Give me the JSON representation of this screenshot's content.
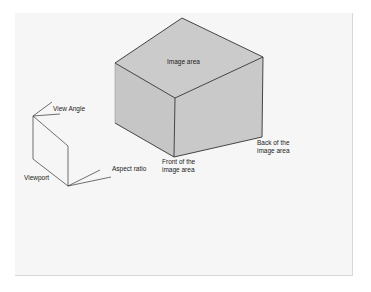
{
  "diagram": {
    "type": "3D viewing volume illustration",
    "colors": {
      "background": "#ffffff",
      "panel": "#f6f6f6",
      "cube_face": "#c8c8c8",
      "cube_top": "#cbcbcb",
      "stroke": "#333333"
    },
    "labels": {
      "image_area": "Image area",
      "view_angle": "View Angle",
      "aspect_ratio": "Aspect ratio",
      "viewport": "Viewport",
      "front": "Front of the\nimage area",
      "back": "Back of the\nimage area"
    },
    "shapes": {
      "cube": "isometric box representing the image area volume",
      "viewport": "wedge/frustum outline representing the viewport"
    }
  }
}
